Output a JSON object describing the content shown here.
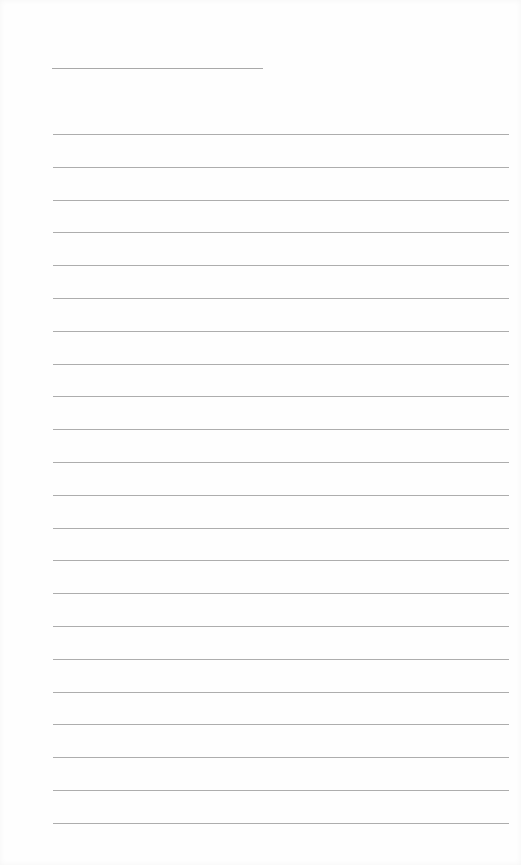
{
  "document": {
    "type": "lined-paper",
    "title_line": {
      "label": ""
    },
    "rules": {
      "count": 22,
      "first_y": 134,
      "spacing": 32.8
    },
    "colors": {
      "background": "#fefefe",
      "rule": "#adadad"
    }
  }
}
